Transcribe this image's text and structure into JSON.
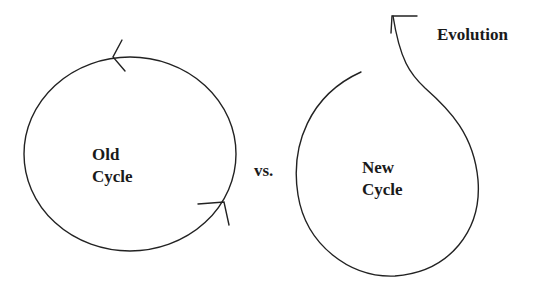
{
  "diagram": {
    "old_cycle": {
      "line1": "Old",
      "line2": "Cycle"
    },
    "separator": "vs.",
    "new_cycle": {
      "line1": "New",
      "line2": "Cycle"
    },
    "evolution_label": "Evolution",
    "stroke_color": "#222222"
  }
}
